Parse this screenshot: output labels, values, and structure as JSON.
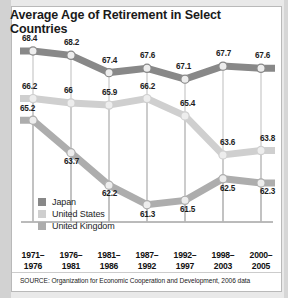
{
  "title": "Average Age of Retirement in Select Countries",
  "source": "SOURCE: Organization for Economic Cooperation and Development, 2006 data",
  "legend": {
    "items": [
      {
        "label": "Japan",
        "color": "#888888"
      },
      {
        "label": "United States",
        "color": "#cfcfcf"
      },
      {
        "label": "United Kingdom",
        "color": "#adadad"
      }
    ]
  },
  "xaxis": {
    "ticks": [
      {
        "line1": "1971–",
        "line2": "1976"
      },
      {
        "line1": "1976–",
        "line2": "1981"
      },
      {
        "line1": "1981–",
        "line2": "1986"
      },
      {
        "line1": "1987–",
        "line2": "1992"
      },
      {
        "line1": "1992–",
        "line2": "1997"
      },
      {
        "line1": "1998–",
        "line2": "2003"
      },
      {
        "line1": "2000–",
        "line2": "2005"
      }
    ]
  },
  "chart_data": {
    "type": "line",
    "title": "Average Age of Retirement in Select Countries",
    "xlabel": "",
    "ylabel": "",
    "ylim": [
      60.5,
      69.0
    ],
    "grid": false,
    "legend_position": "bottom-left",
    "categories": [
      "1971–1976",
      "1976–1981",
      "1981–1986",
      "1987–1992",
      "1992–1997",
      "1998–2003",
      "2000–2005"
    ],
    "series": [
      {
        "name": "Japan",
        "color": "#888888",
        "values": [
          68.4,
          68.2,
          67.4,
          67.6,
          67.1,
          67.7,
          67.6
        ]
      },
      {
        "name": "United States",
        "color": "#cfcfcf",
        "values": [
          66.2,
          66,
          65.9,
          66.2,
          65.4,
          63.6,
          63.8
        ]
      },
      {
        "name": "United Kingdom",
        "color": "#adadad",
        "values": [
          65.2,
          63.7,
          62.2,
          61.3,
          61.5,
          62.5,
          62.3
        ]
      }
    ],
    "labels": {
      "Japan": [
        "68.4",
        "68.2",
        "67.4",
        "67.6",
        "67.1",
        "67.7",
        "67.6"
      ],
      "United States": [
        "66.2",
        "66",
        "65.9",
        "66.2",
        "65.4",
        "63.6",
        "63.8"
      ],
      "United Kingdom": [
        "65.2",
        "63.7",
        "62.2",
        "61.3",
        "61.5",
        "62.5",
        "62.3"
      ]
    }
  }
}
